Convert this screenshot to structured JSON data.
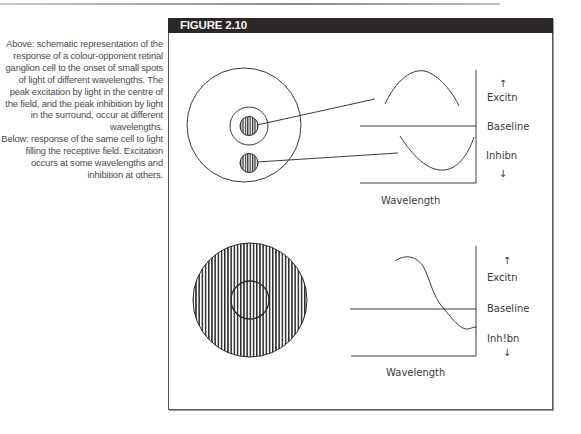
{
  "figure": {
    "title": "FIGURE 2.10"
  },
  "caption": {
    "above": "Above: schematic representation of the response of a colour-opponent retinal ganglion cell to the onset of small spots of light of different wavelengths. The peak excitation by light in the centre of the field, and the peak inhibition by light in the surround, occur at different wavelengths.",
    "below": "Below: response of the same cell to light filling the receptive field. Excitation occurs at some wavelengths and inhibition at others."
  },
  "panels": {
    "top": {
      "axis_labels": {
        "excitation": "Excitn",
        "baseline": "Baseline",
        "inhibition": "Inhibn",
        "x": "Wavelength"
      },
      "stimuli": [
        "centre-spot",
        "surround-spot"
      ]
    },
    "bottom": {
      "axis_labels": {
        "excitation": "Excitn",
        "baseline": "Baseline",
        "inhibition": "Inh!bn",
        "x": "Wavelength"
      },
      "stimuli": [
        "full-field"
      ]
    }
  },
  "colors": {
    "header_bg": "#2b2725",
    "header_text": "#f2f2f2",
    "ink": "#3a3a3a"
  }
}
